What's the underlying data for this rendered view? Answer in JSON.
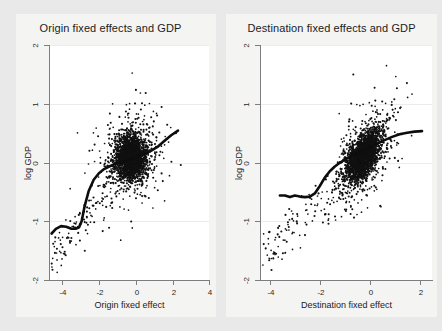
{
  "figure": {
    "background_color": "#e9e9e9",
    "panel_background_color": "#f4f4f3",
    "plot_area_color": "#ffffff",
    "axis_color": "#7d7d82",
    "marker_color": "#111111",
    "curve_color": "#0d0d0d"
  },
  "chart_data": [
    {
      "type": "scatter",
      "title": "Origin fixed effects and GDP",
      "xlabel": "Origin fixed effect",
      "ylabel": "log GDP",
      "xlim": [
        -4.9,
        4.4
      ],
      "ylim": [
        -2.3,
        2.15
      ],
      "xticks": [
        -4,
        -2,
        0,
        2,
        4
      ],
      "xtick_labels": [
        "-4",
        "-2",
        "0",
        "2",
        "4"
      ],
      "yticks": [
        -2,
        -1,
        0,
        1,
        2
      ],
      "ytick_labels": [
        "-2",
        "-1",
        "0",
        "1",
        "2"
      ],
      "grid": false,
      "legend": "none",
      "series": [
        {
          "name": "observations",
          "marker": "point",
          "n_points_approx": 2600,
          "cloud_center": [
            -0.15,
            0.02
          ],
          "cloud_spread_x": 0.78,
          "cloud_spread_y": 0.38,
          "description": "Dense vertically elongated cloud centred near (0,0) with a long thin tail of outliers toward lower-left (origin fixed effect -5 to -2, log GDP -1 to -2)."
        },
        {
          "name": "lowess",
          "marker": "line",
          "x": [
            -4.75,
            -4.5,
            -4.2,
            -3.9,
            -3.6,
            -3.35,
            -3.15,
            -3.0,
            -2.85,
            -2.6,
            -2.3,
            -2.0,
            -1.7,
            -1.4,
            -1.1,
            -0.8,
            -0.5,
            -0.2,
            0.2,
            0.6,
            1.0,
            1.4,
            1.8,
            2.2,
            2.6
          ],
          "y": [
            -1.42,
            -1.33,
            -1.28,
            -1.29,
            -1.33,
            -1.33,
            -1.3,
            -1.18,
            -0.93,
            -0.62,
            -0.4,
            -0.28,
            -0.2,
            -0.15,
            -0.11,
            -0.08,
            -0.05,
            -0.02,
            0.03,
            0.08,
            0.14,
            0.22,
            0.33,
            0.44,
            0.53
          ]
        }
      ]
    },
    {
      "type": "scatter",
      "title": "Destination fixed effects and GDP",
      "xlabel": "Destination fixed effect",
      "ylabel": "log GDP",
      "xlim": [
        -4.4,
        2.5
      ],
      "ylim": [
        -2.3,
        2.15
      ],
      "xticks": [
        -4,
        -2,
        0,
        2
      ],
      "xtick_labels": [
        "-4",
        "-2",
        "0",
        "2"
      ],
      "yticks": [
        -2,
        -1,
        0,
        1,
        2
      ],
      "ytick_labels": [
        "-2",
        "-1",
        "0",
        "1",
        "2"
      ],
      "grid": false,
      "legend": "none",
      "series": [
        {
          "name": "observations",
          "marker": "point",
          "n_points_approx": 2600,
          "cloud_center": [
            -0.25,
            0.05
          ],
          "cloud_spread_x": 0.62,
          "cloud_spread_y": 0.45,
          "correlation": 0.55,
          "description": "Dense diagonally elongated cloud with positive slope centred near (-0.25, 0.05); scattered outliers trail to lower-left down to log GDP -2."
        },
        {
          "name": "lowess",
          "marker": "line",
          "x": [
            -3.6,
            -3.4,
            -3.2,
            -3.0,
            -2.8,
            -2.6,
            -2.4,
            -2.2,
            -2.0,
            -1.8,
            -1.6,
            -1.4,
            -1.2,
            -1.0,
            -0.8,
            -0.6,
            -0.3,
            0.0,
            0.3,
            0.6,
            0.9,
            1.2,
            1.5,
            1.8,
            2.1
          ],
          "y": [
            -0.7,
            -0.7,
            -0.73,
            -0.7,
            -0.72,
            -0.73,
            -0.72,
            -0.66,
            -0.52,
            -0.36,
            -0.24,
            -0.15,
            -0.08,
            -0.02,
            0.03,
            0.08,
            0.14,
            0.21,
            0.28,
            0.35,
            0.41,
            0.46,
            0.49,
            0.51,
            0.52
          ]
        }
      ]
    }
  ]
}
